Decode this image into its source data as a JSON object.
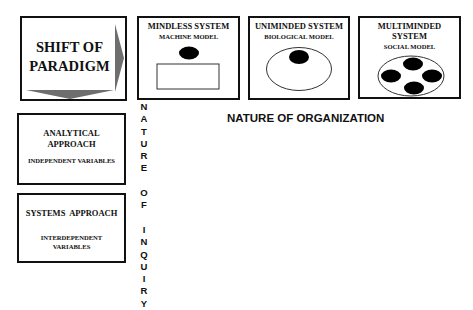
{
  "paradigm": {
    "title": "SHIFT OF\nPARADIGM",
    "arrow_color": "#6e6e6e"
  },
  "models": [
    {
      "title": "MINDLESS SYSTEM",
      "subtitle": "MACHINE MODEL",
      "shape": "black-oval-above-rectangle"
    },
    {
      "title": "UNIMINDED SYSTEM",
      "subtitle": "BIOLOGICAL MODEL",
      "shape": "black-oval-inside-ellipse"
    },
    {
      "title": "MULTIMINDED\nSYSTEM",
      "subtitle": "SOCIAL MODEL",
      "shape": "four-black-ovals-inside-ellipse"
    }
  ],
  "approaches": [
    {
      "title": "ANALYTICAL\nAPPROACH",
      "subtitle": "INDEPENDENT VARIABLES"
    },
    {
      "title": "SYSTEMS  APPROACH",
      "subtitle": "INTERDEPENDENT\nVARIABLES"
    }
  ],
  "axes": {
    "vertical_label": [
      "N",
      "A",
      "T",
      "U",
      "R",
      "E",
      " ",
      "O",
      "F",
      " ",
      "I",
      "N",
      "Q",
      "U",
      "I",
      "R",
      "Y"
    ],
    "vertical_label_text": "NATURE OF INQUIRY",
    "horizontal_label": "NATURE OF ORGANIZATION"
  },
  "colors": {
    "border": "#111111",
    "fill_dark": "#000000",
    "arrow": "#6e6e6e",
    "background": "#ffffff"
  }
}
